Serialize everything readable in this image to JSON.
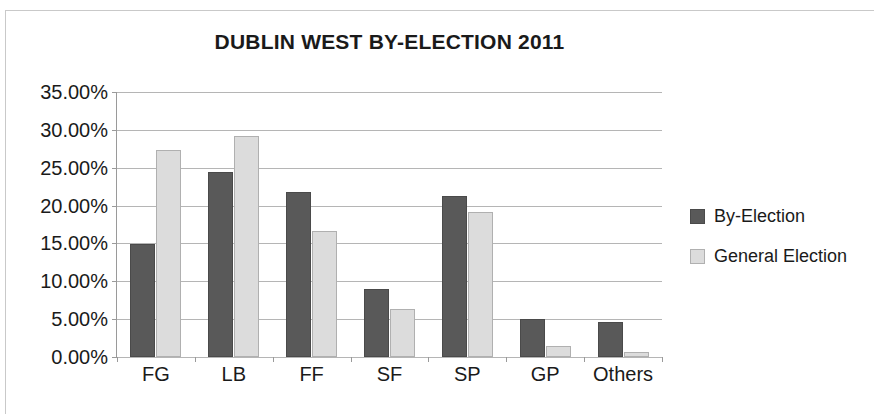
{
  "chart_data": {
    "type": "bar",
    "title": "DUBLIN WEST BY-ELECTION 2011",
    "xlabel": "",
    "ylabel": "",
    "categories": [
      "FG",
      "LB",
      "FF",
      "SF",
      "SP",
      "GP",
      "Others"
    ],
    "series": [
      {
        "name": "By-Election",
        "color": "#595959",
        "values": [
          14.9,
          24.5,
          21.8,
          9.0,
          21.3,
          5.0,
          4.6
        ]
      },
      {
        "name": "General Election",
        "color": "#dcdcdc",
        "values": [
          27.3,
          29.2,
          16.6,
          6.3,
          19.2,
          1.5,
          0.7
        ]
      }
    ],
    "ylim": [
      0,
      35
    ],
    "ytick_values": [
      0,
      5,
      10,
      15,
      20,
      25,
      30,
      35
    ],
    "ytick_labels": [
      "0.00%",
      "5.00%",
      "10.00%",
      "15.00%",
      "20.00%",
      "25.00%",
      "30.00%",
      "35.00%"
    ],
    "grid": true,
    "legend_position": "right"
  },
  "legend": {
    "entries": [
      {
        "label": "By-Election"
      },
      {
        "label": "General Election"
      }
    ]
  }
}
